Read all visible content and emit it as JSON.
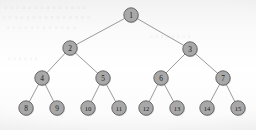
{
  "figure": {
    "kind": "binary-tree-diagram",
    "caption": "",
    "width": 256,
    "height": 130,
    "background_color": "#f7f7f7",
    "node_fill_color": "#a8a8a8",
    "node_stroke_color": "#5d5d5d",
    "edge_color": "#8e8e8e",
    "label_color": "#1d1d1d"
  },
  "tree": {
    "levels": 4,
    "node_radius": 7.2,
    "nodes": [
      {
        "id": "n1",
        "label": "1",
        "cx": 131,
        "cy": 15,
        "level": 0
      },
      {
        "id": "n2",
        "label": "2",
        "cx": 70,
        "cy": 48,
        "level": 1
      },
      {
        "id": "n3",
        "label": "3",
        "cx": 190,
        "cy": 49,
        "level": 1
      },
      {
        "id": "n4",
        "label": "4",
        "cx": 42,
        "cy": 78,
        "level": 2
      },
      {
        "id": "n5",
        "label": "5",
        "cx": 103,
        "cy": 78,
        "level": 2
      },
      {
        "id": "n6",
        "label": "6",
        "cx": 161,
        "cy": 78,
        "level": 2
      },
      {
        "id": "n7",
        "label": "7",
        "cx": 223,
        "cy": 78,
        "level": 2
      },
      {
        "id": "n8",
        "label": "8",
        "cx": 26,
        "cy": 108,
        "level": 3
      },
      {
        "id": "n9",
        "label": "9",
        "cx": 57,
        "cy": 108,
        "level": 3
      },
      {
        "id": "n10",
        "label": "10",
        "cx": 88,
        "cy": 108,
        "level": 3
      },
      {
        "id": "n11",
        "label": "11",
        "cx": 119,
        "cy": 108,
        "level": 3
      },
      {
        "id": "n12",
        "label": "12",
        "cx": 146,
        "cy": 108,
        "level": 3
      },
      {
        "id": "n13",
        "label": "13",
        "cx": 177,
        "cy": 108,
        "level": 3
      },
      {
        "id": "n14",
        "label": "14",
        "cx": 207,
        "cy": 108,
        "level": 3
      },
      {
        "id": "n15",
        "label": "15",
        "cx": 238,
        "cy": 108,
        "level": 3
      }
    ],
    "edges": [
      {
        "from": "n1",
        "to": "n2"
      },
      {
        "from": "n1",
        "to": "n3"
      },
      {
        "from": "n2",
        "to": "n4"
      },
      {
        "from": "n2",
        "to": "n5"
      },
      {
        "from": "n3",
        "to": "n6"
      },
      {
        "from": "n3",
        "to": "n7"
      },
      {
        "from": "n4",
        "to": "n8"
      },
      {
        "from": "n4",
        "to": "n9"
      },
      {
        "from": "n5",
        "to": "n10"
      },
      {
        "from": "n5",
        "to": "n11"
      },
      {
        "from": "n6",
        "to": "n12"
      },
      {
        "from": "n6",
        "to": "n13"
      },
      {
        "from": "n7",
        "to": "n14"
      },
      {
        "from": "n7",
        "to": "n15"
      }
    ]
  },
  "background_ghost_text": {
    "description": "faint bleed-through text from reverse of scanned page",
    "lines": [
      {
        "text": "a a a a a a a a a a a a a a",
        "x": 4,
        "y": 9,
        "size": 7
      },
      {
        "text": "a a a a a a a a a a a a a a a",
        "x": 2,
        "y": 19,
        "size": 7
      },
      {
        "text": "a a a a a a a a a a a a",
        "x": 6,
        "y": 29,
        "size": 7
      },
      {
        "text": "a a a a a a a a",
        "x": 150,
        "y": 38,
        "size": 6
      },
      {
        "text": "a a a a a a",
        "x": 8,
        "y": 60,
        "size": 6
      }
    ]
  }
}
